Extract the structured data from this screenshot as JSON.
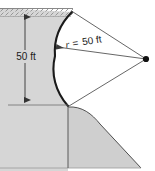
{
  "figure": {
    "labels": {
      "depth": "50 ft",
      "radius_prefix": "r",
      "radius_equals": "=",
      "radius_value": "50 ft",
      "radius_full": "r = 50 ft"
    },
    "colors": {
      "soil_fill": "#d6d6d6",
      "embankment_fill": "#cfcfcf",
      "water_hatch_line": "#8a8a8a",
      "outline_dark": "#1a1a1a",
      "leader_line": "#4a4a4a",
      "dimension_line": "#555555",
      "background": "#ffffff",
      "vertex_dot": "#111111"
    },
    "geometry": {
      "depth_dimension": {
        "x": 25,
        "y_top": 12,
        "y_bottom": 105,
        "arrows": "both"
      },
      "radius_center": {
        "x": 146,
        "y": 59
      },
      "arc": {
        "top": {
          "x": 72,
          "y": 12
        },
        "leftmost": {
          "x": 55,
          "y": 56
        },
        "bottom": {
          "x": 68,
          "y": 106
        }
      },
      "water_surface_band": {
        "x": 0,
        "y": 8,
        "width": 72,
        "height": 8
      }
    }
  }
}
